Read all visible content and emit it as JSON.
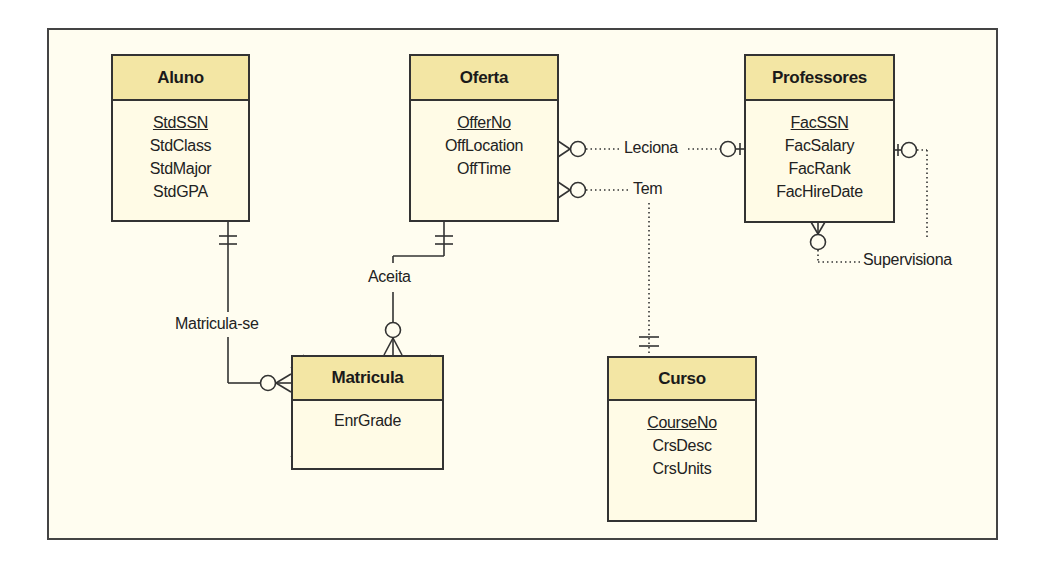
{
  "diagram": {
    "type": "entity-relationship",
    "colors": {
      "header_fill": "#f3e6a4",
      "body_fill": "#fffbe6",
      "background": "#fffdf0",
      "stroke": "#333333"
    },
    "entities": {
      "aluno": {
        "name": "Aluno",
        "attributes": [
          "StdSSN",
          "StdClass",
          "StdMajor",
          "StdGPA"
        ],
        "primary_key": "StdSSN"
      },
      "oferta": {
        "name": "Oferta",
        "attributes": [
          "OfferNo",
          "OffLocation",
          "OffTime"
        ],
        "primary_key": "OfferNo"
      },
      "professores": {
        "name": "Professores",
        "attributes": [
          "FacSSN",
          "FacSalary",
          "FacRank",
          "FacHireDate"
        ],
        "primary_key": "FacSSN"
      },
      "matricula": {
        "name": "Matricula",
        "attributes": [
          "EnrGrade"
        ],
        "weak_entity": true
      },
      "curso": {
        "name": "Curso",
        "attributes": [
          "CourseNo",
          "CrsDesc",
          "CrsUnits"
        ],
        "primary_key": "CourseNo"
      }
    },
    "relationships": {
      "leciona": {
        "name": "Leciona",
        "from": "Oferta",
        "to": "Professores",
        "from_card": "zero-or-many",
        "to_card": "zero-or-one",
        "identifying": false
      },
      "tem": {
        "name": "Tem",
        "from": "Oferta",
        "to": "Curso",
        "from_card": "zero-or-many",
        "to_card": "exactly-one",
        "identifying": false
      },
      "supervisiona": {
        "name": "Supervisiona",
        "from": "Professores",
        "to": "Professores",
        "from_card": "zero-or-many",
        "to_card": "zero-or-one",
        "identifying": false
      },
      "matricula_se": {
        "name": "Matricula-se",
        "from": "Aluno",
        "to": "Matricula",
        "from_card": "exactly-one",
        "to_card": "zero-or-many",
        "identifying": true
      },
      "aceita": {
        "name": "Aceita",
        "from": "Oferta",
        "to": "Matricula",
        "from_card": "exactly-one",
        "to_card": "zero-or-many",
        "identifying": true
      }
    }
  }
}
